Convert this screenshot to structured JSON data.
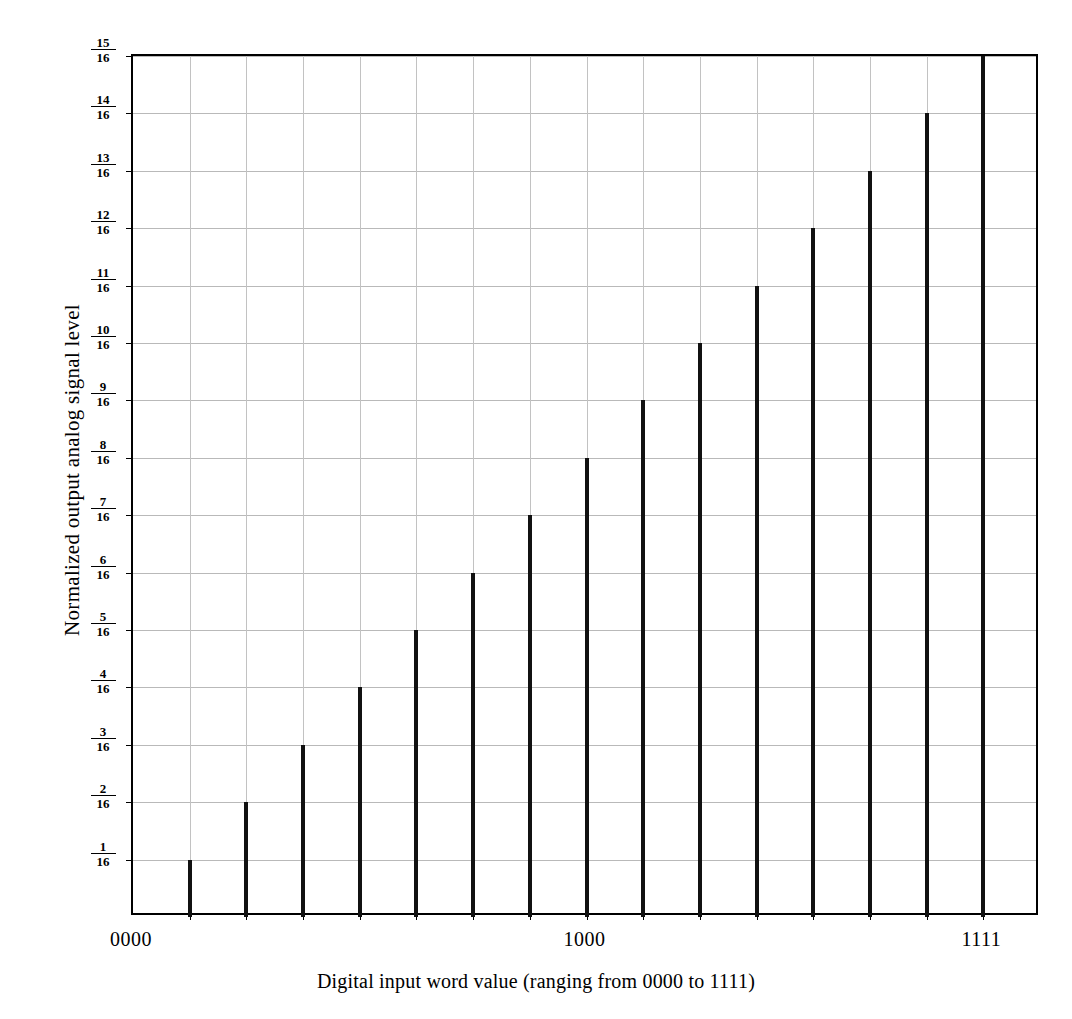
{
  "chart_data": {
    "type": "bar",
    "title": "",
    "xlabel": "Digital input word value (ranging from 0000 to 1111)",
    "ylabel": "Normalized output  analog signal level",
    "categories": [
      "0001",
      "0010",
      "0011",
      "0100",
      "0101",
      "0110",
      "0111",
      "1000",
      "1001",
      "1010",
      "1011",
      "1100",
      "1101",
      "1110",
      "1111"
    ],
    "values": [
      1,
      2,
      3,
      4,
      5,
      6,
      7,
      8,
      9,
      10,
      11,
      12,
      13,
      14,
      15
    ],
    "value_labels": [
      "1/16",
      "2/16",
      "3/16",
      "4/16",
      "5/16",
      "6/16",
      "7/16",
      "8/16",
      "9/16",
      "10/16",
      "11/16",
      "12/16",
      "13/16",
      "14/16",
      "15/16"
    ],
    "ylim": [
      0,
      15
    ],
    "ytick_values": [
      1,
      2,
      3,
      4,
      5,
      6,
      7,
      8,
      9,
      10,
      11,
      12,
      13,
      14,
      15
    ],
    "ytick_labels": [
      {
        "num": "1",
        "den": "16"
      },
      {
        "num": "2",
        "den": "16"
      },
      {
        "num": "3",
        "den": "16"
      },
      {
        "num": "4",
        "den": "16"
      },
      {
        "num": "5",
        "den": "16"
      },
      {
        "num": "6",
        "den": "16"
      },
      {
        "num": "7",
        "den": "16"
      },
      {
        "num": "8",
        "den": "16"
      },
      {
        "num": "9",
        "den": "16"
      },
      {
        "num": "10",
        "den": "16"
      },
      {
        "num": "11",
        "den": "16"
      },
      {
        "num": "12",
        "den": "16"
      },
      {
        "num": "13",
        "den": "16"
      },
      {
        "num": "14",
        "den": "16"
      },
      {
        "num": "15",
        "den": "16"
      }
    ],
    "xtick_labels": [
      {
        "label": "0000",
        "index": 0
      },
      {
        "label": "1000",
        "index": 8
      },
      {
        "label": "1111",
        "index": 15
      }
    ],
    "grid": true,
    "legend": "none",
    "bar_color": "#111111",
    "grid_color": "#b9b9b9",
    "axis_color": "#000000"
  }
}
